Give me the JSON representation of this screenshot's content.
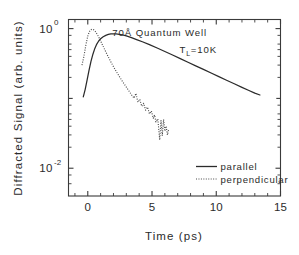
{
  "chart_data": {
    "type": "line",
    "title": "",
    "xlabel": "Time (ps)",
    "ylabel": "Diffracted Signal (arb. units)",
    "xlim": [
      -1.5,
      15
    ],
    "ylim": [
      0.004,
      1.35
    ],
    "yscale": "log",
    "grid": false,
    "legend_position": "lower right",
    "xticks": [
      0,
      5,
      10,
      15
    ],
    "xtick_labels": [
      "0",
      "5",
      "10",
      "15"
    ],
    "yticks": [
      1,
      0.01
    ],
    "ytick_labels": [
      "10",
      "10"
    ],
    "ytick_exponents": [
      "0",
      "-2"
    ],
    "ytick_minor": [
      0.1
    ],
    "annotations": [
      {
        "text": "70Å Quantum Well",
        "x": 5.6,
        "y": 0.78
      },
      {
        "text": "T",
        "sub": "L",
        "text2": "=10K",
        "x": 8.6,
        "y": 0.44
      }
    ],
    "series": [
      {
        "name": "parallel",
        "style": "solid",
        "x": [
          -0.35,
          -0.2,
          -0.05,
          0.1,
          0.25,
          0.4,
          0.55,
          0.7,
          0.85,
          1.0,
          1.2,
          1.4,
          1.6,
          1.8,
          2.0,
          2.2,
          2.45,
          2.7,
          3.0,
          3.4,
          3.8,
          4.3,
          4.8,
          5.4,
          6.0,
          6.6,
          7.2,
          7.8,
          8.4,
          9.0,
          9.6,
          10.2,
          10.8,
          11.4,
          12.0,
          12.5,
          13.0,
          13.4
        ],
        "y": [
          0.105,
          0.135,
          0.185,
          0.255,
          0.34,
          0.43,
          0.52,
          0.6,
          0.665,
          0.715,
          0.765,
          0.8,
          0.825,
          0.838,
          0.842,
          0.838,
          0.828,
          0.812,
          0.785,
          0.742,
          0.697,
          0.642,
          0.588,
          0.527,
          0.47,
          0.418,
          0.372,
          0.33,
          0.293,
          0.26,
          0.231,
          0.205,
          0.182,
          0.162,
          0.144,
          0.131,
          0.119,
          0.112
        ]
      },
      {
        "name": "perpendicular",
        "style": "dotted",
        "x": [
          -0.45,
          -0.3,
          -0.15,
          0.0,
          0.12,
          0.24,
          0.36,
          0.48,
          0.6,
          0.75,
          0.9,
          1.05,
          1.2,
          1.4,
          1.6,
          1.8,
          2.0,
          2.2,
          2.45,
          2.7,
          2.95,
          3.2,
          3.4,
          3.6,
          3.75,
          3.9,
          4.05,
          4.2,
          4.35,
          4.5,
          4.65,
          4.8,
          4.95,
          5.1,
          5.2,
          5.3,
          5.45,
          5.6,
          5.7,
          5.8,
          5.9,
          6.0,
          6.1,
          6.2,
          6.3
        ],
        "y": [
          0.3,
          0.4,
          0.58,
          0.78,
          0.9,
          0.965,
          0.98,
          0.955,
          0.905,
          0.82,
          0.725,
          0.635,
          0.555,
          0.465,
          0.392,
          0.333,
          0.285,
          0.246,
          0.207,
          0.175,
          0.15,
          0.128,
          0.113,
          0.101,
          0.118,
          0.088,
          0.097,
          0.077,
          0.085,
          0.068,
          0.075,
          0.06,
          0.066,
          0.052,
          0.058,
          0.046,
          0.051,
          0.0255,
          0.048,
          0.0295,
          0.05,
          0.034,
          0.04,
          0.03,
          0.036
        ]
      }
    ]
  },
  "legend": {
    "items": [
      {
        "label": "parallel",
        "style": "solid"
      },
      {
        "label": "perpendicular",
        "style": "dotted"
      }
    ]
  }
}
